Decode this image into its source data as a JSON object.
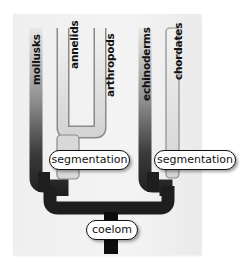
{
  "diagram": {
    "type": "phylogenetic-tree",
    "taxa": [
      {
        "label": "mollusks"
      },
      {
        "label": "annelids"
      },
      {
        "label": "arthropods"
      },
      {
        "label": "echinoderms"
      },
      {
        "label": "chordates"
      }
    ],
    "traits": {
      "root": "coelom",
      "left_segmentation": "segmentation",
      "right_segmentation": "segmentation"
    },
    "colors": {
      "panel": "#f0f0f0",
      "dark_branch": "#222222",
      "light_branch": "#dedede",
      "outline": "#111111"
    }
  }
}
